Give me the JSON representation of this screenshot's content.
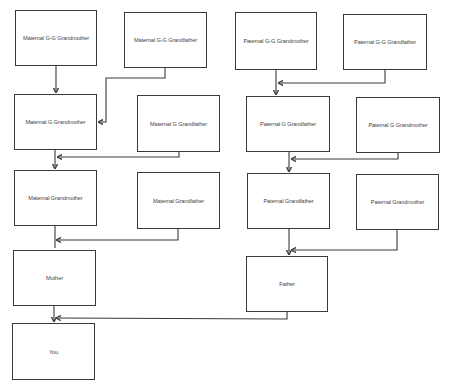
{
  "diagram": {
    "type": "family-tree",
    "nodes": [
      {
        "id": "mggm",
        "label": "Maternal G-G Grandmother",
        "x": 15,
        "y": 10,
        "w": 82,
        "h": 56
      },
      {
        "id": "mggf",
        "label": "Maternal G-G Grandfather",
        "x": 124,
        "y": 12,
        "w": 83,
        "h": 56
      },
      {
        "id": "mgm",
        "label": "Maternal G Grandmother",
        "x": 14,
        "y": 94,
        "w": 83,
        "h": 56
      },
      {
        "id": "mgf",
        "label": "Maternal G Grandfather",
        "x": 137,
        "y": 95,
        "w": 83,
        "h": 57
      },
      {
        "id": "mgrandmother",
        "label": "Maternal Grandmother",
        "x": 14,
        "y": 170,
        "w": 83,
        "h": 56
      },
      {
        "id": "mgrandfather",
        "label": "Maternal Grandfather",
        "x": 137,
        "y": 172,
        "w": 83,
        "h": 57
      },
      {
        "id": "mother",
        "label": "Mother",
        "x": 13,
        "y": 250,
        "w": 83,
        "h": 56
      },
      {
        "id": "you",
        "label": "You",
        "x": 12,
        "y": 323,
        "w": 83,
        "h": 57
      },
      {
        "id": "pggm",
        "label": "Paternal G-G Grandmother",
        "x": 235,
        "y": 12,
        "w": 82,
        "h": 58
      },
      {
        "id": "pggf",
        "label": "Paternal G-G Grandfather",
        "x": 343,
        "y": 14,
        "w": 84,
        "h": 56
      },
      {
        "id": "pgf",
        "label": "Paternal G Grandfather",
        "x": 246,
        "y": 96,
        "w": 84,
        "h": 56
      },
      {
        "id": "pgm",
        "label": "Paternal G Grandmother",
        "x": 356,
        "y": 97,
        "w": 84,
        "h": 56
      },
      {
        "id": "pgrandfather",
        "label": "Paternal Grandfather",
        "x": 247,
        "y": 173,
        "w": 83,
        "h": 56
      },
      {
        "id": "pgrandmother",
        "label": "Paternal Grandmother",
        "x": 356,
        "y": 174,
        "w": 83,
        "h": 56
      },
      {
        "id": "father",
        "label": "Father",
        "x": 246,
        "y": 256,
        "w": 82,
        "h": 56
      }
    ],
    "edges": [
      {
        "from": "mggm",
        "to": "mgm"
      },
      {
        "from": "mggf",
        "to": "mgm"
      },
      {
        "from": "mgm",
        "to": "mgrandmother"
      },
      {
        "from": "mgf",
        "to": "mgrandmother"
      },
      {
        "from": "mgrandmother",
        "to": "mother"
      },
      {
        "from": "mgrandfather",
        "to": "mother"
      },
      {
        "from": "mother",
        "to": "you"
      },
      {
        "from": "father",
        "to": "you"
      },
      {
        "from": "pggm",
        "to": "pgf"
      },
      {
        "from": "pggf",
        "to": "pgf"
      },
      {
        "from": "pgf",
        "to": "pgrandfather"
      },
      {
        "from": "pgm",
        "to": "pgrandfather"
      },
      {
        "from": "pgrandfather",
        "to": "father"
      },
      {
        "from": "pgrandmother",
        "to": "father"
      }
    ],
    "colors": {
      "stroke": "#3a3a3a",
      "text": "#444444",
      "background": "#ffffff"
    }
  }
}
